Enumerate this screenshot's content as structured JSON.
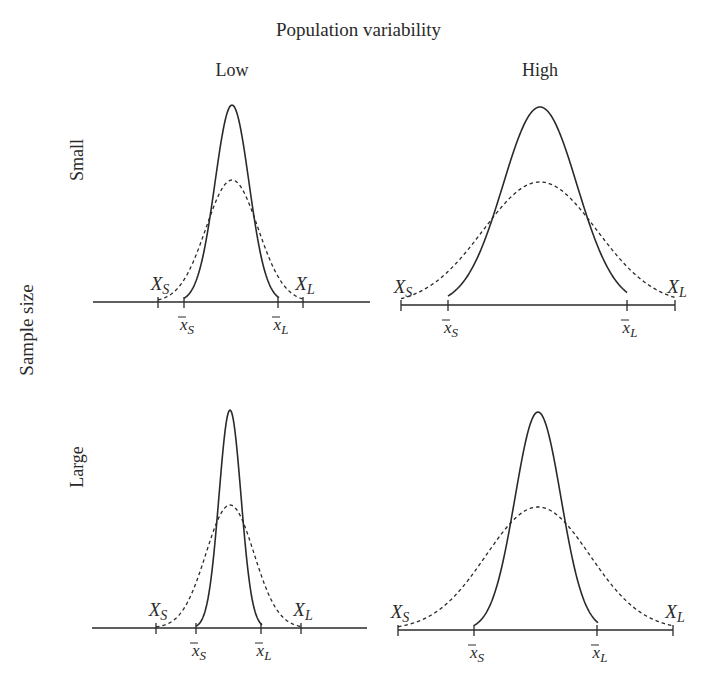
{
  "figure": {
    "title": "Population variability",
    "column_labels": [
      "Low",
      "High"
    ],
    "row_axis_label": "Sample size",
    "row_labels": [
      "Small",
      "Large"
    ],
    "panels": [
      {
        "id": "small-low",
        "row": "Small",
        "column": "Low",
        "baseline_y": 302,
        "axis_x": [
          93,
          370
        ],
        "solid": {
          "center": 232,
          "sigma": 17,
          "peak_y": 105,
          "from": 184,
          "to": 279
        },
        "dashed": {
          "center": 232,
          "sigma": 26,
          "peak_y": 180,
          "from": 158,
          "to": 303
        },
        "ticks": {
          "X_S": 158,
          "xbar_S": 184,
          "xbar_L": 278,
          "X_L": 303
        },
        "end_ticks": false
      },
      {
        "id": "small-high",
        "row": "Small",
        "column": "High",
        "baseline_y": 305,
        "axis_x": [
          401,
          675
        ],
        "solid": {
          "center": 540,
          "sigma": 37,
          "peak_y": 107,
          "from": 448,
          "to": 627
        },
        "dashed": {
          "center": 540,
          "sigma": 57,
          "peak_y": 182,
          "from": 401,
          "to": 675
        },
        "ticks": {
          "X_S": 401,
          "xbar_S": 448,
          "xbar_L": 627,
          "X_L": 675
        },
        "end_ticks": true
      },
      {
        "id": "large-low",
        "row": "Large",
        "column": "Low",
        "baseline_y": 628,
        "axis_x": [
          92,
          367
        ],
        "solid": {
          "center": 230,
          "sigma": 11,
          "peak_y": 410,
          "from": 196,
          "to": 262
        },
        "dashed": {
          "center": 230,
          "sigma": 24,
          "peak_y": 505,
          "from": 156,
          "to": 301
        },
        "ticks": {
          "X_S": 156,
          "xbar_S": 196,
          "xbar_L": 261,
          "X_L": 301
        },
        "end_ticks": false
      },
      {
        "id": "large-high",
        "row": "Large",
        "column": "High",
        "baseline_y": 630,
        "axis_x": [
          398,
          673
        ],
        "solid": {
          "center": 538,
          "sigma": 23,
          "peak_y": 412,
          "from": 474,
          "to": 598
        },
        "dashed": {
          "center": 538,
          "sigma": 52,
          "peak_y": 507,
          "from": 398,
          "to": 673
        },
        "ticks": {
          "X_S": 398,
          "xbar_S": 474,
          "xbar_L": 597,
          "X_L": 673
        },
        "end_ticks": true
      }
    ],
    "tick_labels": {
      "X_S": {
        "main": "X",
        "sub": "S"
      },
      "X_L": {
        "main": "X",
        "sub": "L"
      },
      "xbar_S": {
        "main": "x",
        "sub": "S"
      },
      "xbar_L": {
        "main": "x",
        "sub": "L"
      }
    },
    "legend_meaning": {
      "solid": "sampling distribution of the mean",
      "dashed": "population distribution"
    },
    "colors": {
      "ink": "#2a2a2a",
      "background": "#ffffff"
    }
  }
}
